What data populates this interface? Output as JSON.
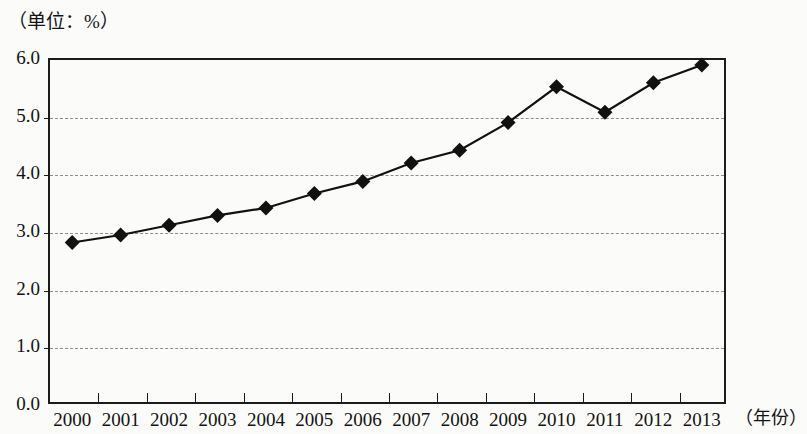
{
  "chart_data": {
    "type": "line",
    "title": "",
    "subtitle": "",
    "unit_note": "（单位：%）",
    "xlabel": "（年份）",
    "ylabel": "",
    "categories": [
      "2000",
      "2001",
      "2002",
      "2003",
      "2004",
      "2005",
      "2006",
      "2007",
      "2008",
      "2009",
      "2010",
      "2011",
      "2012",
      "2013"
    ],
    "values": [
      2.8,
      2.93,
      3.1,
      3.27,
      3.4,
      3.65,
      3.86,
      4.18,
      4.4,
      4.88,
      5.5,
      5.06,
      5.57,
      5.88
    ],
    "series": [
      {
        "name": "比重",
        "values": [
          2.8,
          2.93,
          3.1,
          3.27,
          3.4,
          3.65,
          3.86,
          4.18,
          4.4,
          4.88,
          5.5,
          5.06,
          5.57,
          5.88
        ],
        "marker": "diamond",
        "color": "#111111"
      }
    ],
    "ylim": [
      0.0,
      6.0
    ],
    "y_ticks": [
      "0.0",
      "1.0",
      "2.0",
      "3.0",
      "4.0",
      "5.0",
      "6.0"
    ],
    "y_tick_values": [
      0.0,
      1.0,
      2.0,
      3.0,
      4.0,
      5.0,
      6.0
    ],
    "grid": true,
    "grid_style": "dashed-horizontal",
    "grid_color": "#8d8d8d",
    "legend": "none",
    "legend_position": "none",
    "line_color": "#111111",
    "axis_color": "#1c1c1c",
    "background_color": "#fbfbfa"
  }
}
